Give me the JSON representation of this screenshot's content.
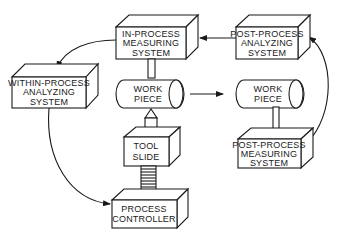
{
  "diagram": {
    "type": "process-measurement-flow",
    "boxes": {
      "in_process_measuring": {
        "lines": [
          "IN-PROCESS",
          "MEASURING",
          "SYSTEM"
        ]
      },
      "post_process_analyzing": {
        "lines": [
          "POST-PROCESS",
          "ANALYZING",
          "SYSTEM"
        ]
      },
      "within_process_analyzing": {
        "lines": [
          "WITHIN-PROCESS",
          "ANALYZING",
          "SYSTEM"
        ]
      },
      "work_piece_left": {
        "lines": [
          "WORK",
          "PIECE"
        ]
      },
      "work_piece_right": {
        "lines": [
          "WORK",
          "PIECE"
        ]
      },
      "tool_slide": {
        "lines": [
          "TOOL",
          "SLIDE"
        ]
      },
      "process_controller": {
        "lines": [
          "PROCESS",
          "CONTROLLER"
        ]
      },
      "post_process_measuring": {
        "lines": [
          "POST-PROCESS",
          "MEASURING",
          "SYSTEM"
        ]
      }
    },
    "connections": [
      {
        "from": "post_process_analyzing",
        "to": "in_process_measuring"
      },
      {
        "from": "in_process_measuring",
        "to": "within_process_analyzing"
      },
      {
        "from": "within_process_analyzing",
        "to": "process_controller"
      },
      {
        "from": "work_piece_left",
        "to": "work_piece_right"
      },
      {
        "from": "post_process_measuring",
        "to": "post_process_analyzing"
      }
    ]
  }
}
